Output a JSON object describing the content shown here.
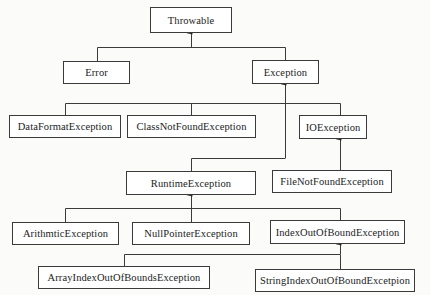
{
  "diagram": {
    "type": "class-hierarchy",
    "nodes": {
      "throwable": {
        "label": "Throwable",
        "box": [
          150,
          7,
          82,
          25
        ]
      },
      "error": {
        "label": "Error",
        "box": [
          63,
          61,
          67,
          23
        ]
      },
      "exception": {
        "label": "Exception",
        "box": [
          252,
          60,
          67,
          23
        ]
      },
      "data_format_exception": {
        "label": "DataFormatException",
        "box": [
          9,
          115,
          112,
          23
        ]
      },
      "class_not_found_exception": {
        "label": "ClassNotFoundException",
        "box": [
          127,
          115,
          129,
          23
        ]
      },
      "io_exception": {
        "label": "IOException",
        "box": [
          299,
          115,
          68,
          23
        ]
      },
      "runtime_exception": {
        "label": "RuntimeException",
        "box": [
          126,
          171,
          130,
          23
        ]
      },
      "file_not_found_exception": {
        "label": "FileNotFoundException",
        "box": [
          272,
          170,
          120,
          23
        ]
      },
      "arithmtic_exception": {
        "label": "ArithmticException",
        "box": [
          12,
          222,
          107,
          23
        ]
      },
      "null_pointer_exception": {
        "label": "NullPointerException",
        "box": [
          132,
          222,
          118,
          23
        ]
      },
      "index_out_of_bound_exception": {
        "label": "IndexOutOfBoundException",
        "box": [
          270,
          220,
          135,
          23
        ]
      },
      "array_index_out_of_bounds_exception": {
        "label": "ArrayIndexOutOfBoundsException",
        "box": [
          38,
          266,
          172,
          23
        ]
      },
      "string_index_out_of_bound_excetpion": {
        "label": "StringIndexOutOfBoundExcetpion",
        "box": [
          255,
          269,
          160,
          23
        ]
      }
    },
    "edges": [
      {
        "from": "error",
        "to": "throwable"
      },
      {
        "from": "exception",
        "to": "throwable"
      },
      {
        "from": "data_format_exception",
        "to": "exception"
      },
      {
        "from": "class_not_found_exception",
        "to": "exception"
      },
      {
        "from": "io_exception",
        "to": "exception"
      },
      {
        "from": "runtime_exception",
        "to": "exception"
      },
      {
        "from": "file_not_found_exception",
        "to": "io_exception"
      },
      {
        "from": "arithmtic_exception",
        "to": "runtime_exception"
      },
      {
        "from": "null_pointer_exception",
        "to": "runtime_exception"
      },
      {
        "from": "index_out_of_bound_exception",
        "to": "runtime_exception"
      },
      {
        "from": "array_index_out_of_bounds_exception",
        "to": "index_out_of_bound_exception"
      },
      {
        "from": "string_index_out_of_bound_excetpion",
        "to": "index_out_of_bound_exception"
      }
    ],
    "colors": {
      "line": "#3a3a3a",
      "box_border": "#3a3a3a",
      "text": "#222222"
    }
  }
}
